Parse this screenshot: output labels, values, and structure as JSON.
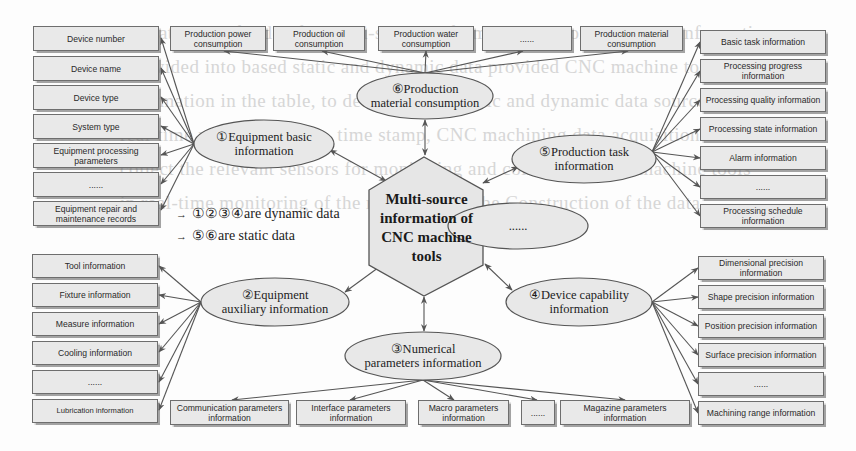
{
  "center": {
    "title": "Multi-source information of CNC machine tools",
    "lines": [
      "Multi-source",
      "information of",
      "CNC machine",
      "tools"
    ]
  },
  "legend": {
    "dynamic": "①②③④are dynamic data",
    "static": "⑤⑥are static data",
    "arrow_icon": "→"
  },
  "categories": {
    "equipment_basic": {
      "label_lines": [
        "①Equipment basic",
        "information"
      ],
      "items": [
        "Device number",
        "Device name",
        "Device type",
        "System type",
        "Equipment processing parameters",
        "......",
        "Equipment repair and maintenance records"
      ]
    },
    "equipment_auxiliary": {
      "label_lines": [
        "②Equipment",
        "auxiliary information"
      ],
      "items": [
        "Tool information",
        "Fixture information",
        "Measure information",
        "Cooling information",
        "......",
        "Lubrication information"
      ]
    },
    "numerical_parameters": {
      "label_lines": [
        "③Numerical",
        "parameters information"
      ],
      "items": [
        "Communication parameters information",
        "Interface parameters information",
        "Macro parameters information",
        "......",
        "Magazine parameters information"
      ]
    },
    "device_capability": {
      "label_lines": [
        "④Device capability",
        "information"
      ],
      "items": [
        "Dimensional precision information",
        "Shape precision information",
        "Position precision information",
        "Surface precision information",
        "......",
        "Machining range information"
      ]
    },
    "production_task": {
      "label_lines": [
        "⑤Production task",
        "information"
      ],
      "items": [
        "Basic task information",
        "Processing progress information",
        "Processing quality information",
        "Processing state information",
        "Alarm information",
        "......",
        "Processing schedule information"
      ]
    },
    "production_material": {
      "label_lines": [
        "⑥Production",
        "material consumption"
      ],
      "items": [
        "Production power consumption",
        "Production oil consumption",
        "Production water consumption",
        "......",
        "Production material consumption"
      ]
    },
    "other": {
      "label_lines": [
        "......"
      ]
    }
  },
  "background_text": [
    "the category of index for multi-source information. According to the  information",
    "is divided into based static and dynamic data provided  CNC machine tools  the",
    "information in the table, to determine the static and dynamic data sources and",
    "real-time monitoring  data, time stamp, CNC machining data acquisition  data",
    "collect the relevant sensors for monitoring and collection. CNC machine tools",
    "in real-time monitoring of the relevant data  the  Construction  of  the  data"
  ],
  "colors": {
    "box_fill": "#e9e9e9",
    "ellipse_fill": "#e8e8e8",
    "stroke": "#555555",
    "text": "#222222"
  }
}
